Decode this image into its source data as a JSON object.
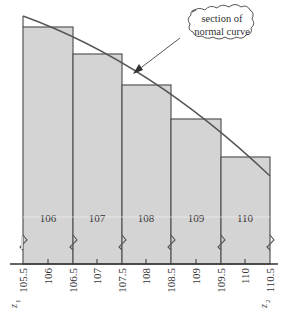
{
  "diagram": {
    "callout": {
      "line1": "section of",
      "line2": "normal curve"
    },
    "bars": [
      {
        "label": "106",
        "left": 105.5,
        "right": 106.5
      },
      {
        "label": "107",
        "left": 106.5,
        "right": 107.5
      },
      {
        "label": "108",
        "left": 107.5,
        "right": 108.5
      },
      {
        "label": "109",
        "left": 108.5,
        "right": 109.5
      },
      {
        "label": "110",
        "left": 109.5,
        "right": 110.5
      }
    ],
    "tick_labels": [
      "105.5",
      "106",
      "106.5",
      "107",
      "107.5",
      "108",
      "108.5",
      "109",
      "109.5",
      "110",
      "110.5"
    ],
    "z_left": {
      "base": "z",
      "sub": "1"
    },
    "z_right": {
      "base": "z",
      "sub": "2"
    },
    "colors": {
      "bar_fill": "#d4d4d4",
      "bar_stroke": "#555555",
      "curve": "#555555",
      "axis": "#333333"
    }
  }
}
